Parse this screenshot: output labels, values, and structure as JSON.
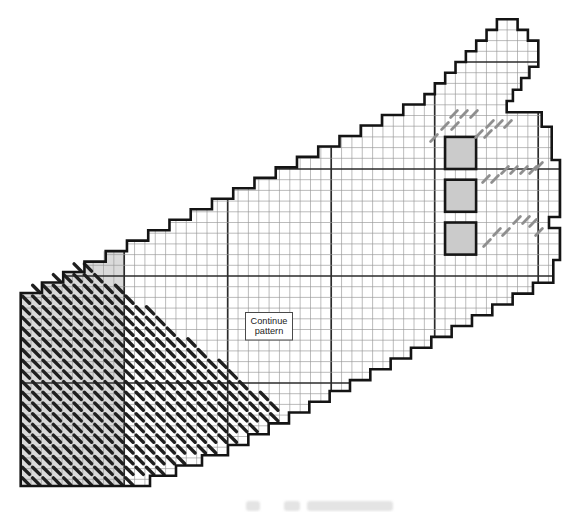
{
  "chart": {
    "title_semantic": "needlepoint-band-stitch-chart",
    "background": "#ffffff",
    "grid": {
      "x0": 20.7,
      "y0": 8.5,
      "cell_w": 10.35,
      "cell_h": 10.7,
      "cols": 54,
      "rows": 46,
      "thin_color": "#979797",
      "thin_width": 0.65,
      "bold_color": "#2b2b2b",
      "bold_width": 1.7,
      "bold_col_mod": 0,
      "bold_row_mod": 5,
      "bold_every": 10
    },
    "outline": {
      "color": "#141414",
      "width": 2.6,
      "ops": [
        [
          "M",
          20.7,
          293
        ],
        [
          "stairH",
          424.5,
          94.1,
          19
        ],
        [
          "stairH",
          496.9,
          19.2,
          7
        ],
        [
          "L",
          517.6,
          19.2
        ],
        [
          "pts",
          [
            [
              517.6,
              29.9
            ],
            [
              527.9,
              29.9
            ],
            [
              527.9,
              40.6
            ],
            [
              538.3,
              40.6
            ],
            [
              538.3,
              66.7
            ],
            [
              529.4,
              66.7
            ],
            [
              529.4,
              78.0
            ],
            [
              521.2,
              78.0
            ],
            [
              521.2,
              89.7
            ],
            [
              512.9,
              89.7
            ],
            [
              512.9,
              101.0
            ],
            [
              506.7,
              101.0
            ],
            [
              506.7,
              112.3
            ],
            [
              541.7,
              112.3
            ],
            [
              541.7,
              126.7
            ],
            [
              551.7,
              126.7
            ],
            [
              551.7,
              160.0
            ],
            [
              560.0,
              160.0
            ],
            [
              560.0,
              217.0
            ],
            [
              549.0,
              217.0
            ],
            [
              549.0,
              228.0
            ],
            [
              560.0,
              228.0
            ],
            [
              560.0,
              260.0
            ],
            [
              553.3,
              260.0
            ],
            [
              553.3,
              272.0
            ]
          ]
        ],
        [
          "stairV",
          228,
          445,
          16
        ],
        [
          "stairV",
          124,
          486,
          4
        ],
        [
          "L",
          20.7,
          486
        ],
        [
          "Z"
        ]
      ]
    },
    "shaded_block": {
      "fill": "#dadada",
      "ops": [
        [
          "M",
          20.7,
          293
        ],
        [
          "stairH",
          124,
          240.7,
          5
        ],
        [
          "L",
          124,
          486
        ],
        [
          "L",
          20.7,
          486
        ],
        [
          "Z"
        ]
      ]
    },
    "eyelet_squares": {
      "fill": "#cbcbcb",
      "stroke": "#161616",
      "stroke_width": 2.6,
      "x": 445.05,
      "w": 31.05,
      "h": 32.1,
      "ys": [
        136.9,
        179.7,
        222.5
      ]
    },
    "gray_stitches": {
      "color": "#8f8f8f",
      "width": 2.8,
      "half_len": 3.4,
      "slant": "/",
      "points": [
        [
          454,
          114
        ],
        [
          464,
          114
        ],
        [
          474,
          114
        ],
        [
          445,
          126
        ],
        [
          455,
          126
        ],
        [
          434,
          138
        ],
        [
          490,
          124
        ],
        [
          499,
          124
        ],
        [
          508,
          124
        ],
        [
          479,
          134
        ],
        [
          488,
          134
        ],
        [
          539,
          166
        ],
        [
          505,
          170
        ],
        [
          514,
          170
        ],
        [
          524,
          170
        ],
        [
          533,
          170
        ],
        [
          486,
          179
        ],
        [
          495,
          179
        ],
        [
          517,
          220
        ],
        [
          526,
          220
        ],
        [
          533,
          223
        ],
        [
          539,
          232
        ],
        [
          497,
          232
        ],
        [
          506,
          232
        ],
        [
          487,
          243
        ]
      ]
    },
    "black_stitches": {
      "color": "#1f1f1f",
      "width": 3.4,
      "half_len": 3.6,
      "slant": "\\",
      "region": {
        "rows": 21,
        "y_start": 267.5,
        "row_step": 10.7,
        "x_start": 25.9,
        "col_step": 10.35,
        "left": {
          "x0": 20.7,
          "slope": 1.97,
          "y_break": 293
        },
        "hyp": {
          "x_at": 232,
          "y_at": 370,
          "slope": 1.35
        },
        "bottom": {
          "x_at": 228,
          "y_break": 445,
          "slope_upper": 1.88,
          "slope_lower": 2.54
        }
      }
    },
    "continue_box": {
      "line1": "Continue",
      "line2": "pattern",
      "x": 245.5,
      "y": 312.5,
      "w": 47,
      "h": 27.5,
      "border": "#4a4a4a",
      "text_color": "#222222",
      "font_size": 9.2
    },
    "caption_smudges": [
      {
        "x": 246,
        "w": 14
      },
      {
        "x": 284,
        "w": 16
      },
      {
        "x": 307,
        "w": 86
      }
    ]
  }
}
